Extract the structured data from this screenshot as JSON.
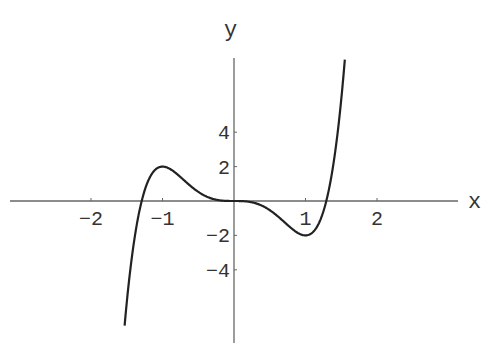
{
  "chart_data": {
    "type": "line",
    "title": "",
    "xlabel": "x",
    "ylabel": "y",
    "function": "y = 3x^5 - 5x^3",
    "xlim": [
      -3.1,
      3.1
    ],
    "ylim": [
      -8.3,
      8.3
    ],
    "grid": false,
    "legend": null,
    "x_ticks": [
      -2,
      -1,
      1,
      2
    ],
    "x_tick_labels": [
      "-2",
      "-1",
      "1",
      "2"
    ],
    "y_ticks": [
      4,
      2,
      -2,
      -4
    ],
    "y_tick_labels": [
      "4",
      "2",
      "-2",
      "-4"
    ],
    "annotations": [
      {
        "label": "local max",
        "x": -1,
        "y": 2
      },
      {
        "label": "local min",
        "x": 1,
        "y": -2
      }
    ],
    "series": [
      {
        "name": "y = 3x^5 - 5x^3",
        "x": [
          -1.53,
          -1.5,
          -1.4,
          -1.3,
          -1.2,
          -1.1,
          -1.0,
          -0.9,
          -0.8,
          -0.7,
          -0.6,
          -0.5,
          -0.4,
          -0.3,
          -0.2,
          -0.1,
          0.0,
          0.1,
          0.2,
          0.3,
          0.4,
          0.5,
          0.6,
          0.7,
          0.8,
          0.9,
          1.0,
          1.1,
          1.2,
          1.3,
          1.4,
          1.5,
          1.55
        ],
        "values": [
          -8.3,
          -5.91,
          -2.12,
          0.15,
          1.32,
          1.82,
          2.0,
          1.87,
          1.58,
          1.21,
          0.85,
          0.53,
          0.29,
          0.13,
          0.04,
          0.005,
          0.0,
          -0.005,
          -0.04,
          -0.13,
          -0.29,
          -0.53,
          -0.85,
          -1.21,
          -1.58,
          -1.87,
          -2.0,
          -1.82,
          -1.32,
          -0.15,
          2.12,
          5.91,
          8.3
        ]
      }
    ]
  },
  "axes": {
    "x_label": "x",
    "y_label": "y"
  }
}
